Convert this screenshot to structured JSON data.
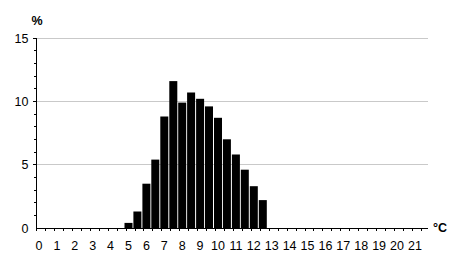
{
  "chart_data": {
    "type": "bar",
    "title": "",
    "ylabel": "%",
    "xlabel": "°C",
    "bin_width": 0.5,
    "x": [
      5.0,
      5.5,
      6.0,
      6.5,
      7.0,
      7.5,
      8.0,
      8.5,
      9.0,
      9.5,
      10.0,
      10.5,
      11.0,
      11.5,
      12.0,
      12.5
    ],
    "values": [
      0.4,
      1.3,
      3.5,
      5.4,
      8.8,
      11.6,
      9.9,
      10.7,
      10.2,
      9.6,
      8.7,
      7.0,
      5.8,
      4.6,
      3.3,
      2.2
    ],
    "x_axis": {
      "tick_labels": [
        "0",
        "1",
        "2",
        "3",
        "4",
        "5",
        "6",
        "7",
        "8",
        "9",
        "10",
        "11",
        "12",
        "13",
        "14",
        "15",
        "16",
        "17",
        "18",
        "19",
        "20",
        "21"
      ],
      "tick_label_step": 1,
      "minor_tick_step": 0.5,
      "unit_label": "°C"
    },
    "y_axis": {
      "tick_labels": [
        "0",
        "5",
        "10",
        "15"
      ],
      "tick_values": [
        0,
        5,
        10,
        15
      ],
      "gridlines": [
        5,
        10,
        15
      ],
      "minor_tick_step": 1,
      "range": [
        0,
        15
      ],
      "unit_label": "%"
    },
    "legend": null,
    "grid": "horizontal-only",
    "colors": {
      "bar": "#000000",
      "gridline": "#c9c9c9",
      "axis": "#000000",
      "text": "#000000",
      "background": "#ffffff"
    }
  }
}
